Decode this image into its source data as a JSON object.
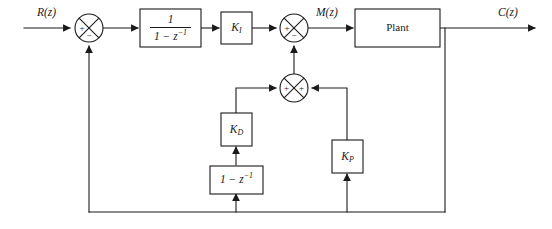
{
  "diagram": {
    "type": "control-system-block-diagram",
    "canvas": {
      "width": 552,
      "height": 229
    },
    "colors": {
      "line": "#1a1a1a",
      "background": "#ffffff",
      "fill": "#ffffff"
    },
    "signals": {
      "input": "R(z)",
      "manipulated": "M(z)",
      "output": "C(z)"
    },
    "blocks": {
      "integrator": {
        "name": "integrator-block",
        "numerator": "1",
        "denominator_base": "1 − z",
        "denominator_exp": "−1",
        "text": "1/(1 − z⁻¹)"
      },
      "ki": {
        "name": "ki-gain-block",
        "base": "K",
        "sub": "I",
        "text": "K_I"
      },
      "kd": {
        "name": "kd-gain-block",
        "base": "K",
        "sub": "D",
        "text": "K_D"
      },
      "kp": {
        "name": "kp-gain-block",
        "base": "K",
        "sub": "P",
        "text": "K_P"
      },
      "differencer": {
        "name": "differencer-block",
        "base": "1 − z",
        "exp": "−1",
        "text": "1 − z⁻¹"
      },
      "plant": {
        "name": "plant-block",
        "text": "Plant"
      }
    },
    "summers": [
      {
        "name": "error-summing-junction",
        "id": "summer-1",
        "cx": 89,
        "cy": 28,
        "r": 14,
        "signs": {
          "left": "+",
          "bottom": "−"
        }
      },
      {
        "name": "control-summing-junction",
        "id": "summer-2",
        "cx": 294,
        "cy": 28,
        "r": 14,
        "signs": {
          "left": "+",
          "bottom": "−"
        }
      },
      {
        "name": "pd-summing-junction",
        "id": "summer-3",
        "cx": 294,
        "cy": 88,
        "r": 14,
        "signs": {
          "left": "+",
          "right": "+"
        }
      }
    ]
  }
}
